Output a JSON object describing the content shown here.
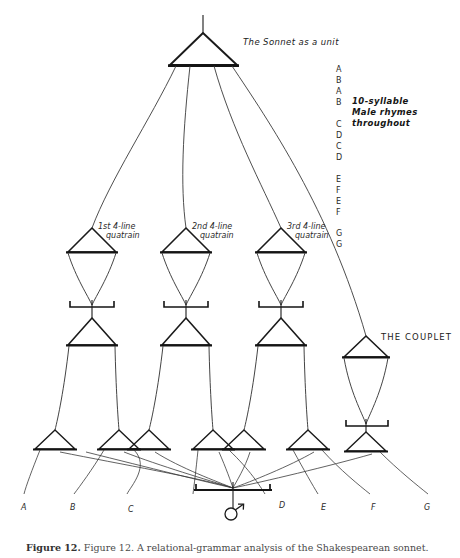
{
  "figure": {
    "title_label": "The Sonnet as a unit",
    "couplet_label": "THE COUPLET",
    "quatrain_labels": [
      {
        "line1": "1st 4-line",
        "line2": "quatrain"
      },
      {
        "line1": "2nd 4-line",
        "line2": "quatrain"
      },
      {
        "line1": "3rd 4-line",
        "line2": "quatrain"
      }
    ],
    "annotation": {
      "line1": "10-syllable",
      "line2": "Male rhymes",
      "line3": "throughout"
    },
    "rhyme_scheme": [
      "A",
      "B",
      "A",
      "B",
      "C",
      "D",
      "C",
      "D",
      "E",
      "F",
      "E",
      "F",
      "G",
      "G"
    ],
    "rhyme_groups": [
      {
        "letters": [
          "A",
          "B",
          "A",
          "B"
        ]
      },
      {
        "letters": [
          "C",
          "D",
          "C",
          "D"
        ]
      },
      {
        "letters": [
          "E",
          "F",
          "E",
          "F"
        ]
      },
      {
        "letters": [
          "G",
          "G"
        ]
      }
    ],
    "bottom_letters": [
      "A",
      "B",
      "C",
      "D",
      "E",
      "F",
      "G"
    ],
    "symbol": "male-symbol",
    "caption": "Figure 12. A relational-grammar analysis of the Shakespearean sonnet.",
    "caption_prefix": "Figure 12.",
    "colors": {
      "ink": "#1a1a1a",
      "paper": "#ffffff",
      "thin_line": "#555555",
      "caption": "#4a4a4a"
    }
  }
}
